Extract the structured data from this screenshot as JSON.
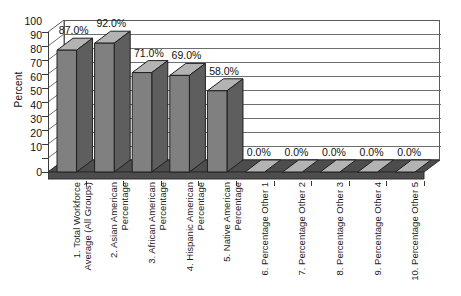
{
  "chart_data": {
    "type": "bar",
    "title": "",
    "subtitle": "",
    "xlabel": "",
    "ylabel": "Percent",
    "ylim": [
      0,
      100
    ],
    "ytick_labels": [
      "100",
      "90",
      "80",
      "70",
      "60",
      "50",
      "40",
      "30",
      "20",
      "10",
      "0"
    ],
    "ytick_values": [
      100,
      90,
      80,
      70,
      60,
      50,
      40,
      30,
      20,
      10,
      0
    ],
    "grid": true,
    "legend": "none",
    "three_d": true,
    "categories": [
      "1. Total Workforce Average (All Groups)",
      "2. Asian American Percentage",
      "3. African American Percentage",
      "4. Hispanic American Percentage",
      "5. Native American Percentage",
      "6. Percentage Other 1",
      "7. Percentage Other 2",
      "8. Percentage Other 3",
      "9. Percentage Other 4",
      "10. Percentage Other 5"
    ],
    "values": [
      87.0,
      92.0,
      71.0,
      69.0,
      58.0,
      0.0,
      0.0,
      0.0,
      0.0,
      0.0
    ],
    "data_labels": [
      "87.0%",
      "92.0%",
      "71.0%",
      "69.0%",
      "58.0%",
      "0.0%",
      "0.0%",
      "0.0%",
      "0.0%",
      "0.0%"
    ],
    "colors": {
      "bar_front": "#808080",
      "bar_top": "#b3b3b3",
      "bar_side": "#5e5e5e",
      "floor": "#4d4d4d",
      "wall": "#ffffff",
      "gridline": "#6e6e6e",
      "axis": "#3a3a3a",
      "text": "#111111"
    }
  }
}
